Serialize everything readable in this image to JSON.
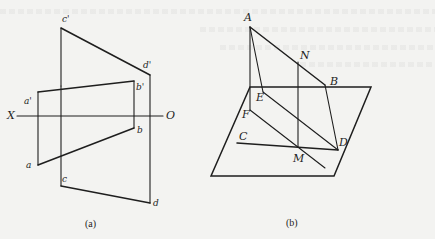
{
  "figure_a": {
    "caption": "(a)",
    "axis": {
      "left_label": "X",
      "right_label": "O"
    },
    "points": {
      "c_prime": "c'",
      "d_prime": "d'",
      "a_prime": "a'",
      "b_prime": "b'",
      "a": "a",
      "b": "b",
      "c": "c",
      "d": "d"
    }
  },
  "figure_b": {
    "caption": "(b)",
    "points": {
      "A": "A",
      "N": "N",
      "B": "B",
      "E": "E",
      "F": "F",
      "C": "C",
      "M": "M",
      "D": "D"
    }
  },
  "colors": {
    "background": "#f3f3f1",
    "line": "#1e1e1e"
  }
}
